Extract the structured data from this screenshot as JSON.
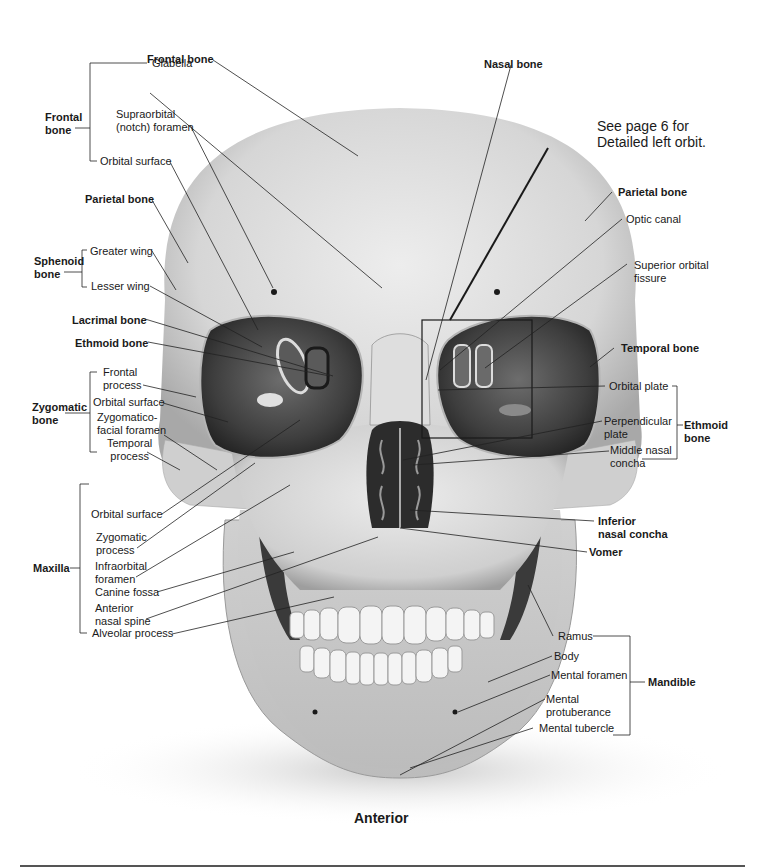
{
  "figure": {
    "caption": "Anterior",
    "note": "See page 6 for\nDetailed left orbit.",
    "colors": {
      "bone_light": "#e6e6e6",
      "bone_mid": "#bdbdbd",
      "bone_shadow": "#8a8a8a",
      "cavity": "#2e2e2e",
      "leader": "#222222"
    }
  },
  "labels": {
    "frontal_bone_top": "Frontal bone",
    "nasal_bone": "Nasal bone",
    "frontal_group": "Frontal\nbone",
    "glabella": "Glabella",
    "supraorbital": "Supraorbital\n(notch) foramen",
    "orbital_surface_frontal": "Orbital surface",
    "parietal_left": "Parietal bone",
    "sphenoid_group": "Sphenoid\nbone",
    "greater_wing": "Greater wing",
    "lesser_wing": "Lesser wing",
    "lacrimal": "Lacrimal bone",
    "ethmoid_left": "Ethmoid bone",
    "zygomatic_group": "Zygomatic\nbone",
    "frontal_process": "Frontal\nprocess",
    "orbital_surface_zyg": "Orbital surface",
    "zygomaticofacial": "Zygomatico-\nfacial foramen",
    "temporal_process": "Temporal\nprocess",
    "maxilla_group": "Maxilla",
    "orbital_surface_max": "Orbital surface",
    "zygomatic_process": "Zygomatic\nprocess",
    "infraorbital": "Infraorbital\nforamen",
    "canine_fossa": "Canine fossa",
    "anterior_nasal_spine": "Anterior\nnasal spine",
    "alveolar_process": "Alveolar process",
    "parietal_right": "Parietal bone",
    "optic_canal": "Optic canal",
    "superior_orbital_fissure": "Superior orbital\nfissure",
    "temporal_bone": "Temporal bone",
    "orbital_plate": "Orbital plate",
    "perpendicular_plate": "Perpendicular\nplate",
    "middle_nasal_concha": "Middle nasal\nconcha",
    "ethmoid_group": "Ethmoid\nbone",
    "inferior_nasal_concha": "Inferior\nnasal concha",
    "vomer": "Vomer",
    "ramus": "Ramus",
    "body": "Body",
    "mental_foramen": "Mental foramen",
    "mental_protuberance": "Mental\nprotuberance",
    "mental_tubercle": "Mental tubercle",
    "mandible_group": "Mandible"
  }
}
